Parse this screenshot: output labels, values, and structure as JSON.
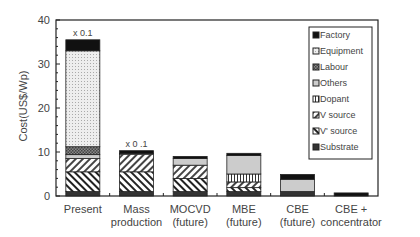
{
  "chart_data": {
    "type": "bar",
    "stacked": true,
    "title": "",
    "xlabel": "",
    "ylabel": "Cost(US$/Wp)",
    "ylim": [
      0,
      40
    ],
    "yticks": [
      0,
      10,
      20,
      30,
      40
    ],
    "categories": [
      "Present",
      "Mass production",
      "MOCVD (future)",
      "MBE (future)",
      "CBE (future)",
      "CBE + concentrator"
    ],
    "category_lines": [
      [
        "Present"
      ],
      [
        "Mass",
        "production"
      ],
      [
        "MOCVD",
        "(future)"
      ],
      [
        "MBE",
        "(future)"
      ],
      [
        "CBE",
        "(future)"
      ],
      [
        "CBE +",
        "concentrator"
      ]
    ],
    "annotations": [
      {
        "category": "Present",
        "text": "x 0.1"
      },
      {
        "category": "Mass production",
        "text": "x 0 .1"
      }
    ],
    "series": [
      {
        "name": "Substrate",
        "pattern": "dark",
        "values": [
          1.0,
          1.0,
          1.0,
          1.0,
          1.0,
          0.0
        ]
      },
      {
        "name": "V' source",
        "pattern": "backslash",
        "values": [
          4.5,
          4.5,
          3.0,
          0.9,
          0.0,
          0.0
        ]
      },
      {
        "name": "V source",
        "pattern": "slash",
        "values": [
          3.0,
          4.0,
          3.0,
          1.3,
          0.0,
          0.0
        ]
      },
      {
        "name": "Dopant",
        "pattern": "vlines",
        "values": [
          0.0,
          0.0,
          0.0,
          1.8,
          0.0,
          0.0
        ]
      },
      {
        "name": "Others",
        "pattern": "lightgray",
        "values": [
          0.9,
          0.0,
          1.5,
          4.2,
          2.8,
          0.0
        ]
      },
      {
        "name": "Labour",
        "pattern": "checker",
        "values": [
          1.8,
          0.0,
          0.0,
          0.0,
          0.0,
          0.0
        ]
      },
      {
        "name": "Equipment",
        "pattern": "dots",
        "values": [
          21.8,
          0.2,
          0.0,
          0.0,
          0.0,
          0.0
        ]
      },
      {
        "name": "Factory",
        "pattern": "black",
        "values": [
          2.5,
          0.6,
          0.5,
          0.5,
          1.1,
          0.7
        ]
      }
    ],
    "legend": {
      "position": "upper right",
      "entries": [
        "Factory",
        "Equipment",
        "Labour",
        "Others",
        "Dopant",
        "V source",
        "V' source",
        "Substrate"
      ]
    },
    "grid": false
  }
}
